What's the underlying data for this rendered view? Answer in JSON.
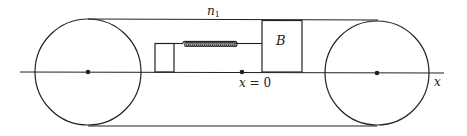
{
  "diagram": {
    "labels": {
      "belt_speed": "n",
      "belt_speed_sub": "1",
      "block": "B",
      "origin_var": "x",
      "origin_eq": " = 0",
      "axis": "x"
    },
    "colors": {
      "stroke": "#222222",
      "background": "#ffffff"
    },
    "elements": [
      "left-pulley",
      "right-pulley",
      "conveyor-belt-top",
      "conveyor-belt-bottom",
      "x-axis",
      "wall-support",
      "spring",
      "block-B",
      "origin-point"
    ]
  }
}
